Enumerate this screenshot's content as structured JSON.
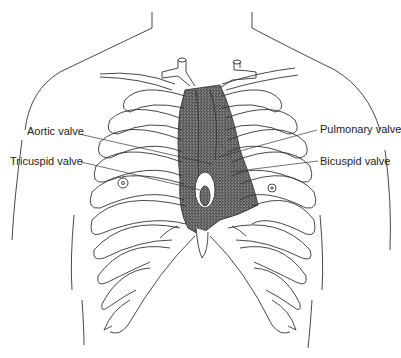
{
  "diagram": {
    "labels": [
      {
        "id": "aortic",
        "text": "Aortic valve"
      },
      {
        "id": "tricuspid",
        "text": "Tricuspid valve"
      },
      {
        "id": "pulmonary",
        "text": "Pulmonary valve"
      },
      {
        "id": "bicuspid",
        "text": "Bicuspid valve"
      }
    ]
  },
  "colors": {
    "line": "#333333",
    "shade": "#bdbdbd",
    "background": "#ffffff"
  }
}
